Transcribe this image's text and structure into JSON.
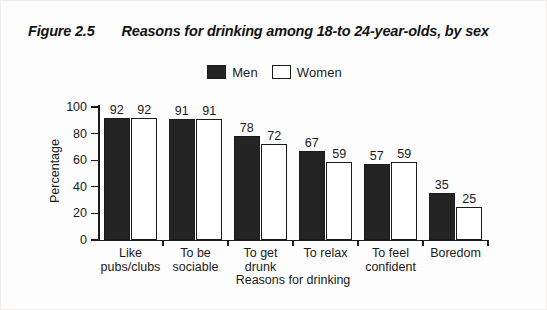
{
  "figure": {
    "number": "Figure 2.5",
    "caption": "Reasons for drinking among 18-to 24-year-olds, by sex"
  },
  "legend": {
    "position": "top-center",
    "entries": [
      {
        "label": "Men",
        "swatch": "filled-black-square"
      },
      {
        "label": "Women",
        "swatch": "open-white-square"
      }
    ]
  },
  "colors": {
    "men_bar": "#242424",
    "women_bar": "#ffffff",
    "outline": "#1b1b1b",
    "text": "#1a1a1a",
    "background": "#fdfdfd"
  },
  "chart_data": {
    "type": "bar",
    "title": "Reasons for drinking among 18-to 24-year-olds, by sex",
    "xlabel": "Reasons for drinking",
    "ylabel": "Percentage",
    "ylim": [
      0,
      100
    ],
    "yticks": [
      0,
      20,
      40,
      60,
      80,
      100
    ],
    "ytick_labels": [
      "0",
      "20",
      "40",
      "60",
      "80",
      "100"
    ],
    "grid": false,
    "legend_position": "top-center",
    "categories": [
      "Like pubs/clubs",
      "To be sociable",
      "To get drunk",
      "To relax",
      "To feel confident",
      "Boredom"
    ],
    "category_lines": [
      [
        "Like",
        "pubs/clubs"
      ],
      [
        "To be",
        "sociable"
      ],
      [
        "To get",
        "drunk"
      ],
      [
        "To relax"
      ],
      [
        "To feel",
        "confident"
      ],
      [
        "Boredom"
      ]
    ],
    "series": [
      {
        "name": "Men",
        "values": [
          92,
          91,
          78,
          67,
          57,
          35
        ]
      },
      {
        "name": "Women",
        "values": [
          92,
          91,
          72,
          59,
          59,
          25
        ]
      }
    ]
  }
}
